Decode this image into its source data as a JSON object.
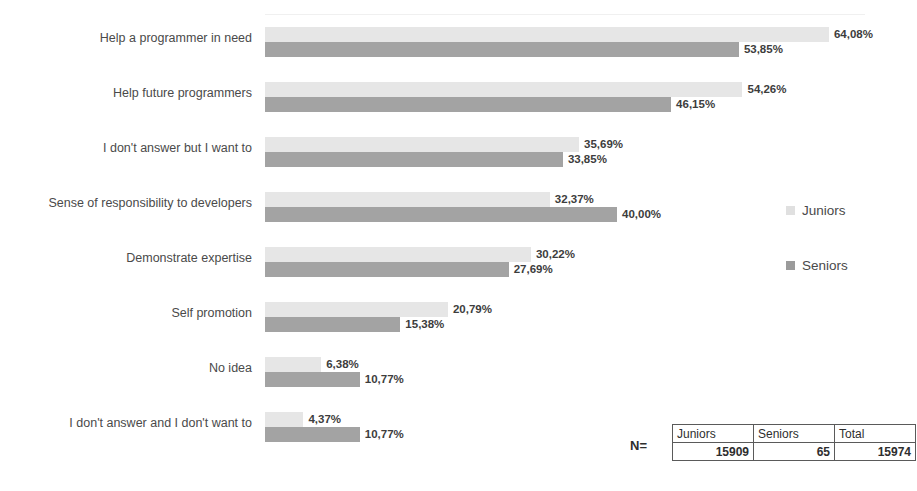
{
  "chart_data": {
    "type": "bar",
    "orientation": "horizontal",
    "title": "",
    "xlabel": "",
    "ylabel": "",
    "xlim": [
      0,
      68
    ],
    "grid": false,
    "legend_position": "right",
    "value_suffix": "%",
    "decimal_separator": ",",
    "categories": [
      "Help a programmer in need",
      "Help future programmers",
      "I don't answer but I want to",
      "Sense of responsibility to developers",
      "Demonstrate expertise",
      "Self promotion",
      "No idea",
      "I don't answer and I don't want to"
    ],
    "series": [
      {
        "name": "Juniors",
        "color": "#e6e6e6",
        "values": [
          64.08,
          54.26,
          35.69,
          32.37,
          30.22,
          20.79,
          6.38,
          4.37
        ],
        "labels": [
          "64,08%",
          "54,26%",
          "35,69%",
          "32,37%",
          "30,22%",
          "20,79%",
          "6,38%",
          "4,37%"
        ]
      },
      {
        "name": "Seniors",
        "color": "#a3a3a3",
        "values": [
          53.85,
          46.15,
          33.85,
          40.0,
          27.69,
          15.38,
          10.77,
          10.77
        ],
        "labels": [
          "53,85%",
          "46,15%",
          "33,85%",
          "40,00%",
          "27,69%",
          "15,38%",
          "10,77%",
          "10,77%"
        ]
      }
    ]
  },
  "legend": {
    "items": [
      {
        "label": "Juniors"
      },
      {
        "label": "Seniors"
      }
    ]
  },
  "n_table": {
    "n_label": "N=",
    "headers": [
      "Juniors",
      "Seniors",
      "Total"
    ],
    "values": [
      "15909",
      "65",
      "15974"
    ]
  }
}
